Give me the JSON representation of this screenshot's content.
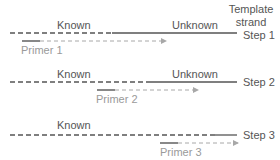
{
  "colors": {
    "template_line": "#555555",
    "primer_solid": "#888888",
    "primer_dashed": "#a8a8a8",
    "label_text": "#555555",
    "primer_label_text": "#9a9a9a"
  },
  "header": {
    "template_label_line1": "Template",
    "template_label_line2": "strand"
  },
  "steps": [
    {
      "step_label": "Step 1",
      "known_label": "Known",
      "unknown_label": "Unknown",
      "primer_label": "Primer 1"
    },
    {
      "step_label": "Step 2",
      "known_label": "Known",
      "unknown_label": "Unknown",
      "primer_label": "Primer 2"
    },
    {
      "step_label": "Step 3",
      "known_label": "Known",
      "primer_label": "Primer 3"
    }
  ]
}
